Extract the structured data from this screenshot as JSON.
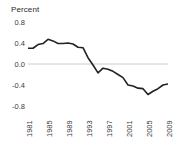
{
  "chart_data": {
    "type": "line",
    "title": "Percent",
    "xlabel": "",
    "ylabel": "Percent",
    "ylim": [
      -0.8,
      0.8
    ],
    "xlim": [
      1981,
      2009
    ],
    "grid": false,
    "zero_line": true,
    "legend": null,
    "ytick_labels": [
      "0.8",
      "0.4",
      "0.0",
      "-0.4",
      "-0.8"
    ],
    "ytick_values": [
      0.8,
      0.4,
      0.0,
      -0.4,
      -0.8
    ],
    "xtick_labels": [
      "1981",
      "1985",
      "1989",
      "1993",
      "1997",
      "2001",
      "2005",
      "2009"
    ],
    "xtick_values": [
      1981,
      1985,
      1989,
      1993,
      1997,
      2001,
      2005,
      2009
    ],
    "line_color": "#222222",
    "zero_line_color": "#cccccc",
    "x": [
      1981,
      1982,
      1983,
      1984,
      1985,
      1986,
      1987,
      1988,
      1989,
      1990,
      1991,
      1992,
      1993,
      1994,
      1995,
      1996,
      1997,
      1998,
      1999,
      2000,
      2001,
      2002,
      2003,
      2004,
      2005,
      2006,
      2007,
      2008,
      2009
    ],
    "values": [
      0.3,
      0.3,
      0.37,
      0.39,
      0.47,
      0.44,
      0.39,
      0.39,
      0.4,
      0.38,
      0.32,
      0.31,
      0.12,
      -0.02,
      -0.17,
      -0.08,
      -0.1,
      -0.14,
      -0.2,
      -0.26,
      -0.4,
      -0.42,
      -0.46,
      -0.47,
      -0.58,
      -0.52,
      -0.47,
      -0.4,
      -0.38
    ],
    "series": [
      {
        "name": "Percent",
        "values": [
          0.3,
          0.3,
          0.37,
          0.39,
          0.47,
          0.44,
          0.39,
          0.39,
          0.4,
          0.38,
          0.32,
          0.31,
          0.12,
          -0.02,
          -0.17,
          -0.08,
          -0.1,
          -0.14,
          -0.2,
          -0.26,
          -0.4,
          -0.42,
          -0.46,
          -0.47,
          -0.58,
          -0.52,
          -0.47,
          -0.4,
          -0.38
        ]
      }
    ]
  }
}
